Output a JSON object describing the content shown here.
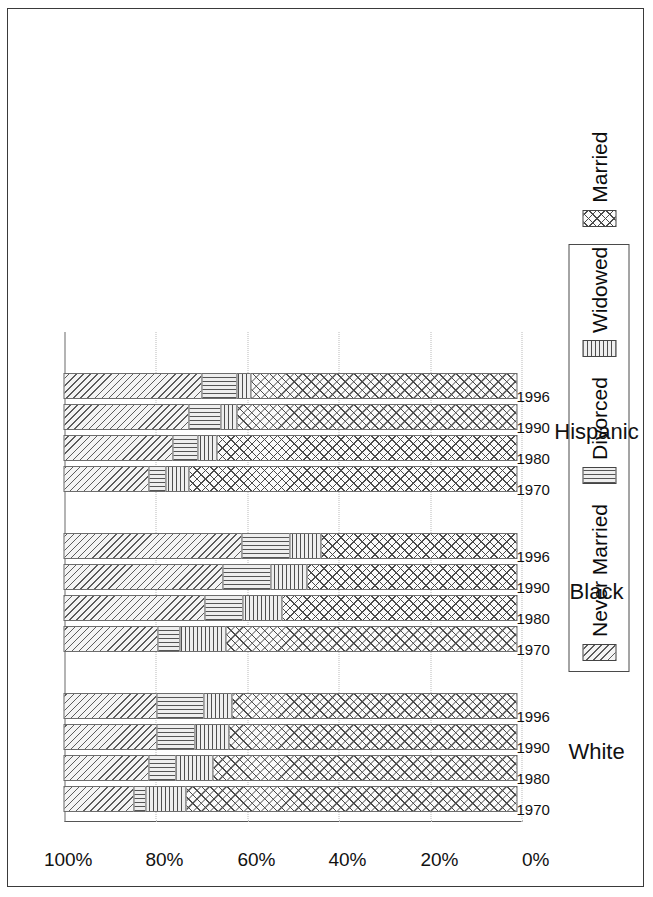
{
  "chart_data": {
    "type": "bar",
    "subtype": "stacked-bar-100-horizontal",
    "title": "",
    "xlabel": "",
    "ylabel": "",
    "ylim": [
      0,
      100
    ],
    "grid": true,
    "orientation": "rotated-90-ccw",
    "legend_position": "top-center",
    "value_ticks": [
      "0%",
      "20%",
      "40%",
      "60%",
      "80%",
      "100%"
    ],
    "value_tick_numbers": [
      0,
      20,
      40,
      60,
      80,
      100
    ],
    "series": [
      {
        "name": "Married",
        "pattern": "cross-hatch",
        "values": [
          72.7,
          66.8,
          63.3,
          62.6,
          64.0,
          51.6,
          46.1,
          43.1,
          71.9,
          65.8,
          61.5,
          58.5
        ]
      },
      {
        "name": "Widowed",
        "pattern": "vertical-lines",
        "values": [
          8.9,
          8.2,
          7.7,
          6.3,
          10.2,
          8.8,
          8.2,
          7.0,
          5.4,
          4.4,
          3.6,
          3.3
        ]
      },
      {
        "name": "Divorced",
        "pattern": "horizontal-lines",
        "values": [
          2.9,
          6.2,
          8.5,
          10.6,
          5.0,
          8.5,
          10.6,
          10.7,
          3.9,
          5.7,
          7.3,
          7.7
        ]
      },
      {
        "name": "Never Married",
        "pattern": "diagonal-hatch",
        "values": [
          15.5,
          18.8,
          20.5,
          20.5,
          20.8,
          31.1,
          35.1,
          39.2,
          18.8,
          24.1,
          27.6,
          30.5
        ]
      }
    ],
    "groups": [
      {
        "label": "White",
        "categories": [
          "1970",
          "1980",
          "1990",
          "1996"
        ],
        "bars": [
          {
            "year": "1970",
            "Married": 72.7,
            "Widowed": 8.9,
            "Divorced": 2.9,
            "Never Married": 15.5
          },
          {
            "year": "1980",
            "Married": 66.8,
            "Widowed": 8.2,
            "Divorced": 6.2,
            "Never Married": 18.8
          },
          {
            "year": "1990",
            "Married": 63.3,
            "Widowed": 7.7,
            "Divorced": 8.5,
            "Never Married": 20.5
          },
          {
            "year": "1996",
            "Married": 62.6,
            "Widowed": 6.3,
            "Divorced": 10.6,
            "Never Married": 20.5
          }
        ]
      },
      {
        "label": "Black",
        "categories": [
          "1970",
          "1980",
          "1990",
          "1996"
        ],
        "bars": [
          {
            "year": "1970",
            "Married": 64.0,
            "Widowed": 10.2,
            "Divorced": 5.0,
            "Never Married": 20.8
          },
          {
            "year": "1980",
            "Married": 51.6,
            "Widowed": 8.8,
            "Divorced": 8.5,
            "Never Married": 31.1
          },
          {
            "year": "1990",
            "Married": 46.1,
            "Widowed": 8.2,
            "Divorced": 10.6,
            "Never Married": 35.1
          },
          {
            "year": "1996",
            "Married": 43.1,
            "Widowed": 7.0,
            "Divorced": 10.7,
            "Never Married": 39.2
          }
        ]
      },
      {
        "label": "Hispanic",
        "categories": [
          "1970",
          "1980",
          "1990",
          "1996"
        ],
        "bars": [
          {
            "year": "1970",
            "Married": 71.9,
            "Widowed": 5.4,
            "Divorced": 3.9,
            "Never Married": 18.8
          },
          {
            "year": "1980",
            "Married": 65.8,
            "Widowed": 4.4,
            "Divorced": 5.7,
            "Never Married": 24.1
          },
          {
            "year": "1990",
            "Married": 61.5,
            "Widowed": 3.6,
            "Divorced": 7.3,
            "Never Married": 27.6
          },
          {
            "year": "1996",
            "Married": 58.5,
            "Widowed": 3.3,
            "Divorced": 7.7,
            "Never Married": 30.5
          }
        ]
      }
    ]
  },
  "legend": {
    "items": [
      {
        "label": "Never Married",
        "swatch": "diagonal-hatch-swatch"
      },
      {
        "label": "Divorced",
        "swatch": "horizontal-lines-swatch"
      },
      {
        "label": "Widowed",
        "swatch": "vertical-lines-swatch"
      },
      {
        "label": "Married",
        "swatch": "cross-hatch-swatch"
      }
    ]
  },
  "axis": {
    "value_labels": [
      "100%",
      "80%",
      "60%",
      "40%",
      "20%",
      "0%"
    ],
    "group_labels": [
      "White",
      "Black",
      "Hispanic"
    ],
    "year_labels": [
      "1970",
      "1980",
      "1990",
      "1996"
    ]
  }
}
